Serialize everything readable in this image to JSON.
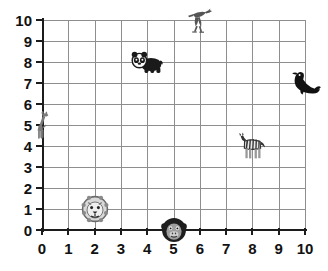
{
  "chart_data": {
    "type": "scatter",
    "title": "",
    "xlabel": "",
    "ylabel": "",
    "xlim": [
      0,
      10
    ],
    "ylim": [
      0,
      10
    ],
    "grid": true,
    "legend": "none",
    "x_ticks": [
      "0",
      "1",
      "2",
      "3",
      "4",
      "5",
      "6",
      "7",
      "8",
      "9",
      "10"
    ],
    "y_ticks": [
      "0",
      "1",
      "2",
      "3",
      "4",
      "5",
      "6",
      "7",
      "8",
      "9",
      "10"
    ],
    "x_tick_values": [
      0,
      1,
      2,
      3,
      4,
      5,
      6,
      7,
      8,
      9,
      10
    ],
    "y_tick_values": [
      0,
      1,
      2,
      3,
      4,
      5,
      6,
      7,
      8,
      9,
      10
    ],
    "point_label_kind": "animal-picture",
    "points": [
      {
        "label": "giraffe",
        "icon": "giraffe-icon",
        "x": 0,
        "y": 5,
        "color": "#7a7a7a"
      },
      {
        "label": "lion",
        "icon": "lion-icon",
        "x": 2,
        "y": 1,
        "color": "#6b6b6b"
      },
      {
        "label": "panda",
        "icon": "panda-icon",
        "x": 4,
        "y": 8,
        "color": "#1a1a1a"
      },
      {
        "label": "monkey",
        "icon": "monkey-icon",
        "x": 5,
        "y": 0,
        "color": "#1a1a1a"
      },
      {
        "label": "bird",
        "icon": "bird-icon",
        "x": 6,
        "y": 10,
        "color": "#555555"
      },
      {
        "label": "zebra",
        "icon": "zebra-icon",
        "x": 8,
        "y": 4,
        "color": "#333333"
      },
      {
        "label": "seal",
        "icon": "seal-icon",
        "x": 10,
        "y": 7,
        "color": "#111111"
      }
    ]
  },
  "colors": {
    "background": "#ffffff",
    "gridline": "#8e8e8e",
    "axis": "#1c1c1c",
    "label_text": "#111111"
  }
}
